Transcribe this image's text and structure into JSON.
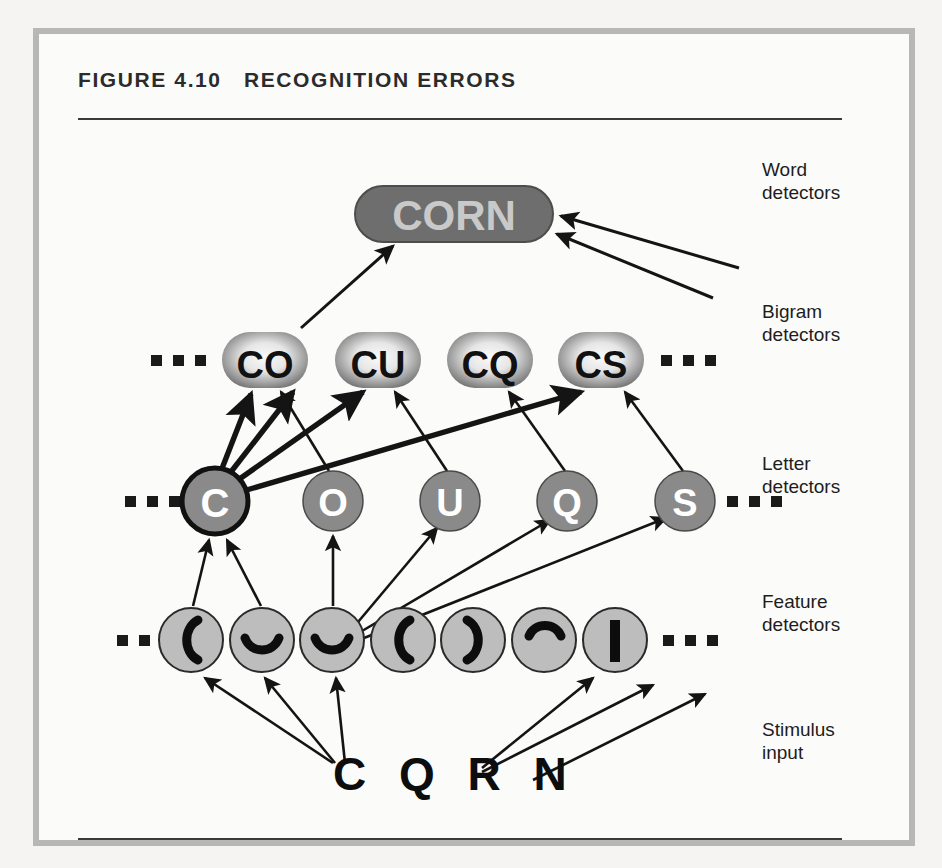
{
  "figure": {
    "number_label": "FIGURE 4.10",
    "title": "RECOGNITION ERRORS",
    "heading_full": "FIGURE 4.10   RECOGNITION ERRORS"
  },
  "row_labels": [
    {
      "id": "word",
      "text": "Word\ndetectors"
    },
    {
      "id": "bigram",
      "text": "Bigram\ndetectors"
    },
    {
      "id": "letter",
      "text": "Letter\ndetectors"
    },
    {
      "id": "feature",
      "text": "Feature\ndetectors"
    },
    {
      "id": "stimulus",
      "text": "Stimulus\ninput"
    }
  ],
  "word_layer": {
    "nodes": [
      {
        "id": "word-corn",
        "label": "CORN",
        "cx": 421,
        "cy": 186,
        "rx": 99,
        "ry": 28,
        "fill": "#6e6e6e",
        "text_color": "#c9c9c9"
      }
    ]
  },
  "bigram_layer": {
    "ellipsis_left": "...",
    "ellipsis_right": "...",
    "nodes": [
      {
        "id": "bigram-co",
        "label": "CO",
        "cx": 232,
        "cy": 332,
        "rx": 43,
        "ry": 28
      },
      {
        "id": "bigram-cu",
        "label": "CU",
        "cx": 345,
        "cy": 332,
        "rx": 43,
        "ry": 28
      },
      {
        "id": "bigram-cq",
        "label": "CQ",
        "cx": 457,
        "cy": 332,
        "rx": 43,
        "ry": 28
      },
      {
        "id": "bigram-cs",
        "label": "CS",
        "cx": 568,
        "cy": 332,
        "rx": 43,
        "ry": 28
      }
    ]
  },
  "letter_layer": {
    "ellipsis_left": "...",
    "ellipsis_right": "...",
    "nodes": [
      {
        "id": "letter-c",
        "label": "C",
        "cx": 182,
        "cy": 473,
        "r": 33,
        "active": true
      },
      {
        "id": "letter-o",
        "label": "O",
        "cx": 300,
        "cy": 473,
        "r": 30,
        "active": false
      },
      {
        "id": "letter-u",
        "label": "U",
        "cx": 417,
        "cy": 473,
        "r": 30,
        "active": false
      },
      {
        "id": "letter-q",
        "label": "Q",
        "cx": 534,
        "cy": 473,
        "r": 30,
        "active": false
      },
      {
        "id": "letter-s",
        "label": "S",
        "cx": 652,
        "cy": 473,
        "r": 30,
        "active": false
      }
    ]
  },
  "feature_layer": {
    "ellipsis_left": "...",
    "ellipsis_right": "...",
    "nodes": [
      {
        "id": "feature-1",
        "glyph": "left-paren",
        "cx": 158,
        "cy": 612,
        "r": 32
      },
      {
        "id": "feature-2",
        "glyph": "bottom-curve",
        "cx": 229,
        "cy": 612,
        "r": 32
      },
      {
        "id": "feature-3",
        "glyph": "bottom-curve",
        "cx": 299,
        "cy": 612,
        "r": 32
      },
      {
        "id": "feature-4",
        "glyph": "left-paren",
        "cx": 370,
        "cy": 612,
        "r": 32
      },
      {
        "id": "feature-5",
        "glyph": "right-paren",
        "cx": 440,
        "cy": 612,
        "r": 32
      },
      {
        "id": "feature-6",
        "glyph": "top-curve",
        "cx": 511,
        "cy": 612,
        "r": 32
      },
      {
        "id": "feature-7",
        "glyph": "vertical-bar",
        "cx": 582,
        "cy": 612,
        "r": 32
      }
    ]
  },
  "stimulus_layer": {
    "text": "C Q R N",
    "letters": [
      "C",
      "Q",
      "R",
      "N"
    ],
    "x": 300,
    "y": 755
  },
  "colors": {
    "frame": "#b7b7b7",
    "paper": "#fbfbfa",
    "word_node_fill": "#6e6e6e",
    "word_node_text": "#c9c9c9",
    "bigram_edge": "#6f6f6f",
    "bigram_center": "#f2f2f2",
    "bigram_text": "#111111",
    "letter_fill": "#8a8a8a",
    "letter_text": "#ffffff",
    "feature_fill": "#bdbdbd",
    "feature_stroke": "#2a2a2a",
    "arrow": "#141414",
    "rule": "#3a3a3a",
    "heading_text": "#2b2b2b"
  }
}
